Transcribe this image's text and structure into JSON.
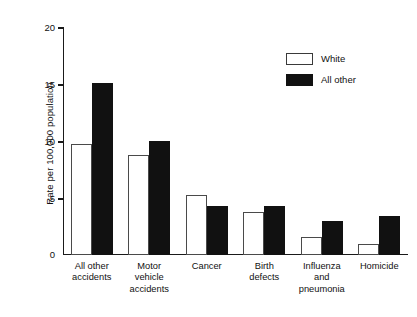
{
  "chart_data": {
    "type": "bar",
    "title": "",
    "subtitle": "",
    "xlabel": "",
    "ylabel": "Rate per 100,000 population",
    "ylim": [
      0,
      20
    ],
    "yticks": [
      0,
      5,
      10,
      15,
      20
    ],
    "ytick_labels": [
      "0",
      "5",
      "10",
      "15",
      "20"
    ],
    "grid": false,
    "legend_position": "top-right",
    "categories": [
      "All other accidents",
      "Motor vehicle accidents",
      "Cancer",
      "Birth defects",
      "Influenza and pneumonia",
      "Homicide"
    ],
    "category_lines": [
      [
        "All other",
        "accidents"
      ],
      [
        "Motor",
        "vehicle",
        "accidents"
      ],
      [
        "Cancer"
      ],
      [
        "Birth",
        "defects"
      ],
      [
        "Influenza",
        "and",
        "pneumonia"
      ],
      [
        "Homicide"
      ]
    ],
    "series": [
      {
        "name": "White",
        "color": "#ffffff",
        "edge_color": "#4a4a4a",
        "values": [
          9.7,
          8.8,
          5.3,
          3.8,
          1.6,
          1.0
        ]
      },
      {
        "name": "All other",
        "color": "#111111",
        "edge_color": "#111111",
        "values": [
          15.1,
          10.0,
          4.3,
          4.3,
          3.0,
          3.4
        ]
      }
    ]
  },
  "legend": {
    "items": [
      {
        "label": "White",
        "swatch": "white-swatch"
      },
      {
        "label": "All other",
        "swatch": "black-swatch"
      }
    ]
  },
  "axis": {
    "y_title": "Rate per 100,000 population",
    "y_tick_20": "20",
    "y_tick_15": "15",
    "y_tick_10": "10",
    "y_tick_5": "5",
    "y_tick_0": "0"
  }
}
